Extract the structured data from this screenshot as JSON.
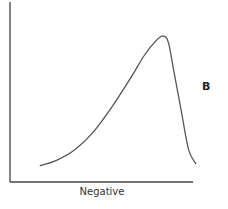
{
  "chart_data": {
    "type": "line",
    "title": "",
    "panel_label": "B",
    "xlabel": "Negative",
    "ylabel": "",
    "grid": false,
    "legend": null,
    "ticks": {
      "x": [],
      "y": []
    },
    "xlim": [
      0,
      1
    ],
    "ylim": [
      0,
      1
    ],
    "series": [
      {
        "name": "distribution",
        "x": [
          0.16,
          0.25,
          0.35,
          0.45,
          0.55,
          0.65,
          0.72,
          0.78,
          0.82,
          0.85,
          0.88,
          0.92,
          0.96,
          1.0
        ],
        "values": [
          0.09,
          0.12,
          0.18,
          0.28,
          0.42,
          0.58,
          0.7,
          0.78,
          0.81,
          0.78,
          0.62,
          0.4,
          0.18,
          0.1
        ]
      }
    ],
    "colors": {
      "line": "#555555",
      "axis": "#444444",
      "text": "#222222"
    }
  }
}
